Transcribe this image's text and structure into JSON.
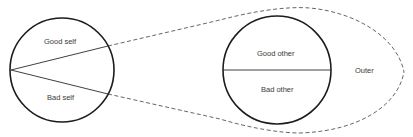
{
  "diagram": {
    "type": "object-relations-diagram",
    "self_circle": {
      "upper_label": "Good self",
      "lower_label": "Bad self",
      "center": [
        62,
        70
      ],
      "radius": 52
    },
    "other_circle": {
      "upper_label": "Good other",
      "lower_label": "Bad other",
      "center": [
        277,
        70
      ],
      "radius": 54
    },
    "outer_region": {
      "label": "Outer",
      "boundary_style": "dashed"
    },
    "colors": {
      "stroke": "#1c1c1c",
      "dashed_stroke": "#555555",
      "text": "#3a3a3a",
      "background": "#ffffff"
    }
  }
}
